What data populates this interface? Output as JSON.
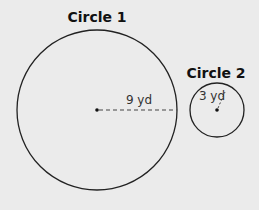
{
  "diagram": {
    "background": "#ebebeb",
    "circles": [
      {
        "title": "Circle 1",
        "radius_label": "9 yd",
        "cx": 97,
        "cy": 110,
        "r": 80
      },
      {
        "title": "Circle 2",
        "radius_label": "3 yd",
        "cx": 217,
        "cy": 110,
        "r": 27
      }
    ]
  }
}
